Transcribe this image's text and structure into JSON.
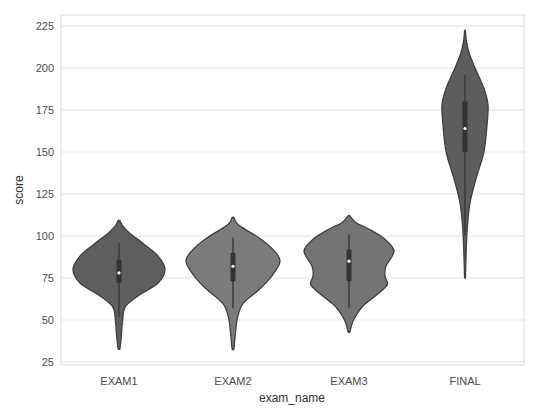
{
  "chart_data": {
    "type": "violin",
    "title": "",
    "xlabel": "exam_name",
    "ylabel": "score",
    "categories": [
      "EXAM1",
      "EXAM2",
      "EXAM3",
      "FINAL"
    ],
    "ylim": [
      22,
      232
    ],
    "yticks": [
      25,
      50,
      75,
      100,
      125,
      150,
      175,
      200,
      225
    ],
    "grid": "horizontal",
    "legend": "none",
    "series": [
      {
        "name": "EXAM1",
        "color": "#5e5e5e",
        "min_extent": 33,
        "max_extent": 109,
        "whisker_low": 52,
        "q1": 72,
        "median": 78,
        "q3": 86,
        "whisker_high": 96,
        "density": [
          [
            33,
            0.02
          ],
          [
            40,
            0.05
          ],
          [
            50,
            0.08
          ],
          [
            58,
            0.14
          ],
          [
            65,
            0.45
          ],
          [
            72,
            0.85
          ],
          [
            80,
            1.0
          ],
          [
            88,
            0.85
          ],
          [
            95,
            0.55
          ],
          [
            102,
            0.22
          ],
          [
            106,
            0.08
          ],
          [
            109,
            0.02
          ]
        ]
      },
      {
        "name": "EXAM2",
        "color": "#7b7b7b",
        "min_extent": 33,
        "max_extent": 111,
        "whisker_low": 57,
        "q1": 73,
        "median": 82,
        "q3": 90,
        "whisker_high": 99,
        "density": [
          [
            33,
            0.02
          ],
          [
            42,
            0.05
          ],
          [
            52,
            0.1
          ],
          [
            60,
            0.22
          ],
          [
            68,
            0.55
          ],
          [
            76,
            0.82
          ],
          [
            85,
            1.0
          ],
          [
            92,
            0.85
          ],
          [
            99,
            0.55
          ],
          [
            105,
            0.2
          ],
          [
            108,
            0.07
          ],
          [
            111,
            0.02
          ]
        ]
      },
      {
        "name": "EXAM3",
        "color": "#747474",
        "min_extent": 43,
        "max_extent": 112,
        "whisker_low": 57,
        "q1": 73,
        "median": 85,
        "q3": 92,
        "whisker_high": 101,
        "density": [
          [
            43,
            0.02
          ],
          [
            50,
            0.1
          ],
          [
            58,
            0.3
          ],
          [
            65,
            0.62
          ],
          [
            71,
            0.85
          ],
          [
            76,
            0.8
          ],
          [
            82,
            0.82
          ],
          [
            91,
            1.0
          ],
          [
            98,
            0.8
          ],
          [
            104,
            0.45
          ],
          [
            108,
            0.15
          ],
          [
            112,
            0.02
          ]
        ]
      },
      {
        "name": "FINAL",
        "color": "#5d5d5d",
        "min_extent": 76,
        "max_extent": 222,
        "whisker_low": 100,
        "q1": 150,
        "median": 164,
        "q3": 180,
        "whisker_high": 196,
        "density": [
          [
            76,
            0.02
          ],
          [
            90,
            0.05
          ],
          [
            105,
            0.1
          ],
          [
            120,
            0.22
          ],
          [
            135,
            0.5
          ],
          [
            150,
            0.82
          ],
          [
            165,
            0.95
          ],
          [
            178,
            1.0
          ],
          [
            188,
            0.82
          ],
          [
            198,
            0.5
          ],
          [
            208,
            0.2
          ],
          [
            216,
            0.06
          ],
          [
            222,
            0.02
          ]
        ]
      }
    ]
  },
  "axes": {
    "x_label": "exam_name",
    "y_label": "score",
    "y_tick_labels": [
      "25",
      "50",
      "75",
      "100",
      "125",
      "150",
      "175",
      "200",
      "225"
    ],
    "x_tick_labels": [
      "EXAM1",
      "EXAM2",
      "EXAM3",
      "FINAL"
    ]
  }
}
